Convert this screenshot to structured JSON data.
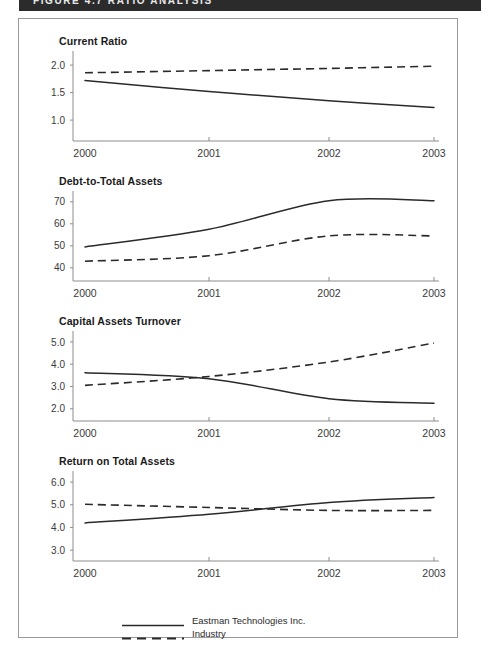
{
  "banner": {
    "text": "FIGURE 4.7    RATIO ANALYSIS"
  },
  "legend": {
    "entries": [
      {
        "label": "Eastman Technologies Inc.",
        "style": "solid"
      },
      {
        "label": "Industry",
        "style": "dashed"
      }
    ]
  },
  "x_axis": {
    "categories": [
      "2000",
      "2001",
      "2002",
      "2003"
    ]
  },
  "chart_data": [
    {
      "type": "line",
      "title": "Current Ratio",
      "xlabel": "",
      "ylabel": "",
      "categories": [
        "2000",
        "2001",
        "2002",
        "2003"
      ],
      "yticks": [
        "2.0",
        "1.5",
        "1.0"
      ],
      "ytick_values": [
        2.0,
        1.5,
        1.0
      ],
      "ylim": [
        0.62,
        2.22
      ],
      "grid": false,
      "legend_position": "bottom",
      "series": [
        {
          "name": "Eastman Technologies Inc.",
          "style": "solid",
          "values": [
            1.72,
            1.52,
            1.35,
            1.23
          ]
        },
        {
          "name": "Industry",
          "style": "dashed",
          "values": [
            1.86,
            1.9,
            1.94,
            1.98
          ]
        }
      ]
    },
    {
      "type": "line",
      "title": "Debt-to-Total Assets",
      "xlabel": "",
      "ylabel": "",
      "categories": [
        "2000",
        "2001",
        "2002",
        "2003"
      ],
      "yticks": [
        "70",
        "60",
        "50",
        "40"
      ],
      "ytick_values": [
        70,
        60,
        50,
        40
      ],
      "ylim": [
        34,
        74
      ],
      "grid": false,
      "legend_position": "bottom",
      "series": [
        {
          "name": "Eastman Technologies Inc.",
          "style": "solid",
          "values": [
            49.5,
            57.5,
            70.5,
            70.5
          ]
        },
        {
          "name": "Industry",
          "style": "dashed",
          "values": [
            43.0,
            45.5,
            54.5,
            54.5
          ]
        }
      ]
    },
    {
      "type": "line",
      "title": "Capital Assets Turnover",
      "xlabel": "",
      "ylabel": "",
      "categories": [
        "2000",
        "2001",
        "2002",
        "2003"
      ],
      "yticks": [
        "5.0",
        "4.0",
        "3.0",
        "2.0"
      ],
      "ytick_values": [
        5.0,
        4.0,
        3.0,
        2.0
      ],
      "ylim": [
        1.45,
        5.4
      ],
      "grid": false,
      "legend_position": "bottom",
      "series": [
        {
          "name": "Eastman Technologies Inc.",
          "style": "solid",
          "values": [
            3.62,
            3.35,
            2.45,
            2.25
          ]
        },
        {
          "name": "Industry",
          "style": "dashed",
          "values": [
            3.05,
            3.45,
            4.1,
            4.95
          ]
        }
      ]
    },
    {
      "type": "line",
      "title": "Return on Total Assets",
      "xlabel": "",
      "ylabel": "",
      "categories": [
        "2000",
        "2001",
        "2002",
        "2003"
      ],
      "yticks": [
        "6.0",
        "5.0",
        "4.0",
        "3.0"
      ],
      "ytick_values": [
        6.0,
        5.0,
        4.0,
        3.0
      ],
      "ylim": [
        2.52,
        6.4
      ],
      "grid": false,
      "legend_position": "bottom",
      "series": [
        {
          "name": "Eastman Technologies Inc.",
          "style": "solid",
          "values": [
            4.2,
            4.58,
            5.1,
            5.32
          ]
        },
        {
          "name": "Industry",
          "style": "dashed",
          "values": [
            5.02,
            4.88,
            4.75,
            4.75
          ]
        }
      ]
    }
  ],
  "colors": {
    "banner_bg": "#2b2b2b",
    "panel_border": "#9a9a9a",
    "axis": "#8d8d8d",
    "series_line": "#2a2a2a",
    "text": "#1a1a1a"
  }
}
